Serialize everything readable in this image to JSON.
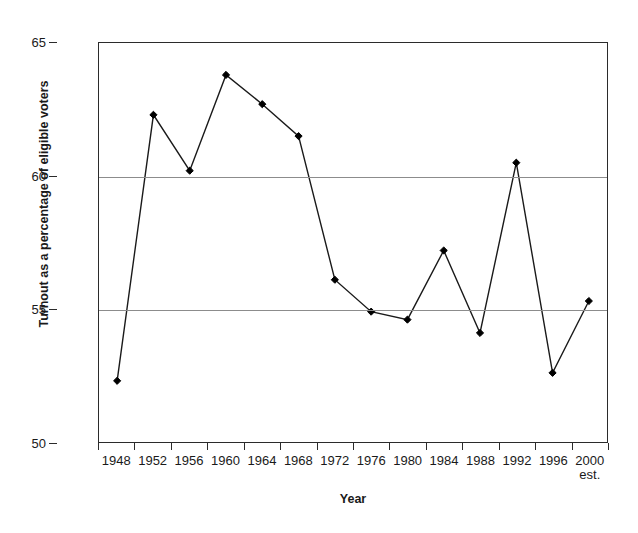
{
  "chart_data": {
    "type": "line",
    "title": "",
    "xlabel": "Year",
    "ylabel": "Turnout as a percentage of eligible voters",
    "categories": [
      "1948",
      "1952",
      "1956",
      "1960",
      "1964",
      "1968",
      "1972",
      "1976",
      "1980",
      "1984",
      "1988",
      "1992",
      "1996",
      "2000"
    ],
    "category_sublabels": [
      "",
      "",
      "",
      "",
      "",
      "",
      "",
      "",
      "",
      "",
      "",
      "",
      "",
      "est."
    ],
    "values": [
      52.3,
      62.3,
      60.2,
      63.8,
      62.7,
      61.5,
      56.1,
      54.9,
      54.6,
      57.2,
      54.1,
      60.5,
      52.6,
      55.3
    ],
    "series": [
      {
        "name": "Turnout",
        "values": [
          52.3,
          62.3,
          60.2,
          63.8,
          62.7,
          61.5,
          56.1,
          54.9,
          54.6,
          57.2,
          54.1,
          60.5,
          52.6,
          55.3
        ]
      }
    ],
    "ylim": [
      50,
      65
    ],
    "yticks": [
      50,
      55,
      60,
      65
    ],
    "ytick_labels": [
      "50",
      "55",
      "60",
      "65"
    ],
    "grid": "horizontal",
    "gridlines_at": [
      55,
      60
    ],
    "legend": "none",
    "marker": "diamond",
    "line_color": "#1a1a1a",
    "marker_color": "#000000",
    "grid_color": "#8c8c8c",
    "axis_color": "#2b2b2b",
    "background": "#ffffff"
  }
}
